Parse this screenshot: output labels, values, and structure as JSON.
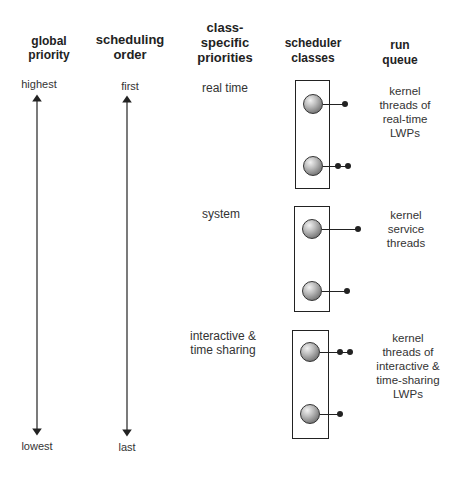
{
  "headers": {
    "global_priority": [
      "global",
      "priority"
    ],
    "scheduling_order": [
      "scheduling",
      "order"
    ],
    "class_specific_priorities": [
      "class-",
      "specific",
      "priorities"
    ],
    "scheduler_classes": [
      "scheduler",
      "classes"
    ],
    "run_queue": [
      "run",
      "queue"
    ]
  },
  "global_priority": {
    "top": "highest",
    "bottom": "lowest"
  },
  "scheduling_order": {
    "top": "first",
    "bottom": "last"
  },
  "classes": [
    {
      "name": [
        "real time"
      ],
      "run_queue": [
        "kernel",
        "threads of",
        "real-time",
        "LWPs"
      ],
      "threads_per_level": [
        1,
        2
      ]
    },
    {
      "name": [
        "system"
      ],
      "run_queue": [
        "kernel",
        "service",
        "threads"
      ],
      "threads_per_level": [
        1,
        1
      ]
    },
    {
      "name": [
        "interactive &",
        "time sharing"
      ],
      "run_queue": [
        "kernel",
        "threads of",
        "interactive &",
        "time-sharing",
        "LWPs"
      ],
      "threads_per_level": [
        2,
        1
      ]
    }
  ],
  "colors": {
    "line": "#222222",
    "text": "#333333",
    "ball_highlight": "#f2f2f2",
    "ball_shadow": "#4a4a4a"
  }
}
